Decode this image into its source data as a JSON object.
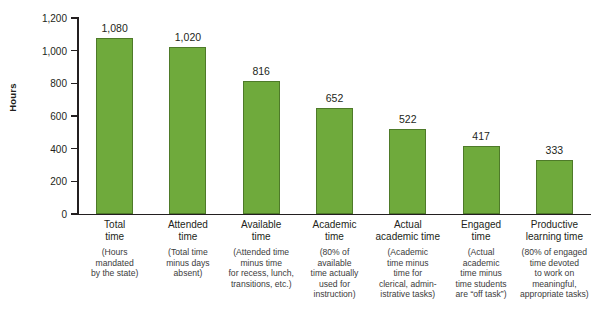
{
  "chart_data": {
    "type": "bar",
    "title": "",
    "xlabel": "",
    "ylabel": "Hours",
    "ylim": [
      0,
      1200
    ],
    "yticks": [
      0,
      200,
      400,
      600,
      800,
      1000,
      1200
    ],
    "ytick_labels": [
      "0",
      "200",
      "400",
      "600",
      "800",
      "1,000",
      "1,200"
    ],
    "grid": false,
    "legend": "none",
    "bar_color": "#6faa3c",
    "bar_border_color": "#4e7a29",
    "categories": [
      "Total time",
      "Attended time",
      "Available time",
      "Academic time",
      "Actual academic time",
      "Engaged time",
      "Productive learning time"
    ],
    "values": [
      1080,
      1020,
      816,
      652,
      522,
      417,
      333
    ],
    "value_labels": [
      "1,080",
      "1,020",
      "816",
      "652",
      "522",
      "417",
      "333"
    ],
    "category_lines": [
      {
        "main": [
          "Total",
          "time"
        ],
        "sub": [
          "(Hours",
          "mandated",
          "by the state)"
        ]
      },
      {
        "main": [
          "Attended",
          "time"
        ],
        "sub": [
          "(Total time",
          "minus days",
          "absent)"
        ]
      },
      {
        "main": [
          "Available",
          "time"
        ],
        "sub": [
          "(Attended time",
          "minus time",
          "for recess, lunch,",
          "transitions, etc.)"
        ]
      },
      {
        "main": [
          "Academic",
          "time"
        ],
        "sub": [
          "(80% of",
          "available",
          "time actually",
          "used for",
          "instruction)"
        ]
      },
      {
        "main": [
          "Actual",
          "academic time"
        ],
        "sub": [
          "(Academic",
          "time minus",
          "time for",
          "clerical, admin-",
          "istrative tasks)"
        ]
      },
      {
        "main": [
          "Engaged",
          "time"
        ],
        "sub": [
          "(Actual",
          "academic",
          "time minus",
          "time students",
          "are “off task”)"
        ]
      },
      {
        "main": [
          "Productive",
          "learning time"
        ],
        "sub": [
          "(80% of engaged",
          "time devoted",
          "to work on",
          "meaningful,",
          "appropriate tasks)"
        ]
      }
    ]
  }
}
